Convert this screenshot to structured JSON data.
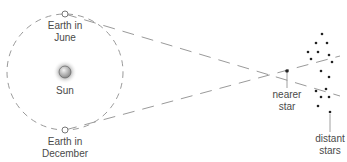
{
  "labels": {
    "earth_june_1": "Earth in",
    "earth_june_2": "June",
    "sun": "Sun",
    "earth_dec_1": "Earth in",
    "earth_dec_2": "December",
    "nearer_1": "nearer",
    "nearer_2": "star",
    "distant_1": "distant",
    "distant_2": "stars"
  },
  "geometry": {
    "orbit": {
      "cx": 65,
      "cy": 72,
      "r": 58
    },
    "earth_june": {
      "x": 65,
      "y": 14
    },
    "earth_december": {
      "x": 65,
      "y": 130
    },
    "sun": {
      "x": 65,
      "y": 72
    },
    "nearer_star": {
      "x": 287,
      "y": 71
    },
    "distant_stars": [
      [
        322,
        34
      ],
      [
        316,
        43
      ],
      [
        327,
        43
      ],
      [
        308,
        52
      ],
      [
        318,
        52
      ],
      [
        329,
        55
      ],
      [
        311,
        59
      ],
      [
        332,
        62
      ],
      [
        321,
        71
      ],
      [
        329,
        77
      ],
      [
        316,
        91
      ],
      [
        326,
        89
      ],
      [
        321,
        97
      ],
      [
        329,
        97
      ],
      [
        318,
        106
      ],
      [
        330,
        112
      ]
    ]
  },
  "colors": {
    "line": "#9a9a9a",
    "text": "#4a4a4a",
    "star": "#222222"
  }
}
